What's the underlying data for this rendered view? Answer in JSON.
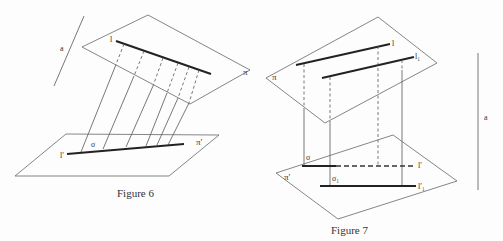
{
  "figures": [
    {
      "caption": "Figure 6",
      "labels": {
        "direction": "a",
        "line": "l",
        "plane_upper": "π",
        "plane_lower": "π′",
        "projection": "l′",
        "projection_fn": "σ"
      }
    },
    {
      "caption": "Figure 7",
      "labels": {
        "direction": "a",
        "line": "l",
        "line2": "l₁",
        "plane_upper": "π",
        "plane_lower": "π′",
        "projection": "l′",
        "projection2": "l′₁",
        "projection_fn": "σ",
        "projection_fn2": "σ₁"
      }
    }
  ]
}
